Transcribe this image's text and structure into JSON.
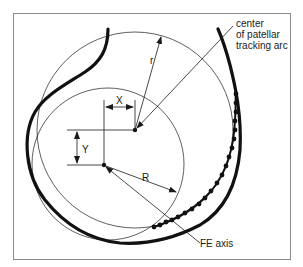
{
  "figure": {
    "labels": {
      "r": "r",
      "R": "R",
      "X": "X",
      "Y": "Y",
      "center_line1": "center",
      "center_line2": "of patellar",
      "center_line3": "tracking arc",
      "fe_axis": "FE axis"
    },
    "elements": {
      "large_circle": {
        "label": "r",
        "description": "patellar tracking arc circle"
      },
      "small_circle": {
        "label": "R",
        "description": "FE axis circle"
      },
      "patellar_center": {
        "label": "center of patellar tracking arc"
      },
      "fe_axis_point": {
        "label": "FE axis"
      },
      "offset_x": {
        "label": "X"
      },
      "offset_y": {
        "label": "Y"
      }
    },
    "colors": {
      "line": "#1a1a1a",
      "background": "#ffffff",
      "frame": "#8a8a8a"
    }
  }
}
